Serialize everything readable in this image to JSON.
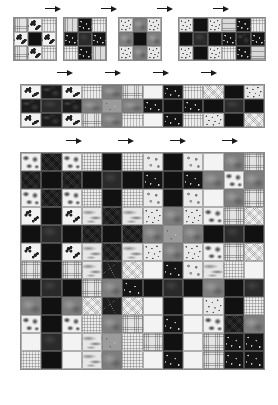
{
  "figure": {
    "background_color": "#ffffff",
    "border_color": "#8a8a8a",
    "arrow_color": "#1a1a1a",
    "arrow_glyph": "right-arrow",
    "levels": [
      {
        "name": "level-1",
        "description": "Four seed panels: 3x3 and 6x3 checkerboards of texture patches",
        "arrow_count": 4
      },
      {
        "name": "level-2",
        "description": "Concatenated strip: 12x3 checkerboard of texture patches",
        "arrow_count": 4
      },
      {
        "name": "level-3",
        "description": "Full expansion: 12x12 checkerboard of texture patches",
        "arrow_count": 4
      }
    ]
  },
  "palette": {
    "dark": "#141414",
    "light": "#ebebeb",
    "mid": "#8c8c8c",
    "grid_line": "#8a8a8a"
  },
  "chart_data": {
    "type": "heatmap",
    "xlabel": "",
    "ylabel": "",
    "grid": true,
    "legend": "none",
    "level1_panels": [
      {
        "id": "panel-1",
        "cols": 3,
        "rows": 3,
        "x": 13,
        "y": 17,
        "w": 44,
        "h": 44,
        "cells": [
          [
            "t-weave-light",
            "t-flower",
            "t-weave-fine"
          ],
          [
            "t-flower",
            "t-plain-dark",
            "t-flower"
          ],
          [
            "t-weave-light",
            "t-flower",
            "t-weave-fine"
          ]
        ]
      },
      {
        "id": "panel-2",
        "cols": 3,
        "rows": 3,
        "x": 63,
        "y": 17,
        "w": 44,
        "h": 44,
        "cells": [
          [
            "t-vstripe",
            "t-dots-dark",
            "t-weave-fine"
          ],
          [
            "t-dots-dark",
            "t-stone-dark",
            "t-dots-dark"
          ],
          [
            "t-weave-fine",
            "t-dots-dark",
            "t-vstripe"
          ]
        ]
      },
      {
        "id": "panel-3",
        "cols": 3,
        "rows": 3,
        "x": 118,
        "y": 17,
        "w": 44,
        "h": 44,
        "cells": [
          [
            "t-speckle-light",
            "t-stone-mid",
            "t-speckle-light"
          ],
          [
            "t-stone-mid",
            "t-plain-dark",
            "t-stone-mid"
          ],
          [
            "t-speckle-light",
            "t-stone-mid",
            "t-speckle-light"
          ]
        ]
      },
      {
        "id": "panel-4",
        "cols": 6,
        "rows": 3,
        "x": 178,
        "y": 17,
        "w": 88,
        "h": 44,
        "cells": [
          [
            "t-speckle-light",
            "t-plain-dark",
            "t-speckle-light",
            "t-hstripe",
            "t-dots-dark",
            "t-weave-fine"
          ],
          [
            "t-plain-dark",
            "t-stone-dark",
            "t-plain-dark",
            "t-dots-dark",
            "t-blob-dark",
            "t-dots-dark"
          ],
          [
            "t-speckle-light",
            "t-plain-dark",
            "t-speckle-light",
            "t-weave-fine",
            "t-dots-dark",
            "t-hstripe"
          ]
        ]
      }
    ],
    "level2_strip": {
      "id": "strip",
      "cols": 12,
      "rows": 3,
      "x": 20,
      "y": 84,
      "w": 245,
      "h": 44,
      "cells": [
        [
          "t-flower",
          "t-blob-dark",
          "t-flower",
          "t-weave-fine",
          "t-stone-mid",
          "t-weave-light",
          "t-plain-light",
          "t-dots-dark",
          "t-weave-fine",
          "t-noise-light",
          "t-plain-dark",
          "t-speckle-light"
        ],
        [
          "t-blob-dark",
          "t-stone-dark",
          "t-blob-dark",
          "t-stone-mid",
          "t-grain-mid",
          "t-stone-mid",
          "t-dots-dark",
          "t-plain-dark",
          "t-dots-dark",
          "t-plain-dark",
          "t-stone-dark",
          "t-plain-dark"
        ],
        [
          "t-flower",
          "t-blob-dark",
          "t-flower",
          "t-weave-light",
          "t-stone-mid",
          "t-weave-fine",
          "t-plain-light",
          "t-dots-dark",
          "t-weave-fine",
          "t-speckle-light",
          "t-plain-dark",
          "t-noise-light"
        ]
      ]
    },
    "level3_grid": {
      "id": "grid",
      "cols": 12,
      "rows": 12,
      "x": 20,
      "y": 152,
      "w": 245,
      "h": 218,
      "cells": [
        [
          "t-blob-light",
          "t-noise-dark",
          "t-blob-light",
          "t-weave-fine",
          "t-plain-dark",
          "t-weave-fine",
          "t-pebble-light",
          "t-plain-dark",
          "t-pebble-light",
          "t-plain-light",
          "t-stone-mid",
          "t-weave-light"
        ],
        [
          "t-noise-dark",
          "t-plain-dark",
          "t-noise-dark",
          "t-plain-dark",
          "t-stone-dark",
          "t-plain-dark",
          "t-dots-dark",
          "t-plain-dark",
          "t-dots-dark",
          "t-stone-mid",
          "t-blob-light",
          "t-stone-mid"
        ],
        [
          "t-blob-light",
          "t-noise-dark",
          "t-blob-light",
          "t-weave-fine",
          "t-plain-dark",
          "t-weave-fine",
          "t-pebble-light",
          "t-plain-dark",
          "t-pebble-light",
          "t-plain-light",
          "t-stone-mid",
          "t-weave-light"
        ],
        [
          "t-flower",
          "t-plain-dark",
          "t-flower",
          "t-marble",
          "t-noise-dark",
          "t-marble",
          "t-speckle-light",
          "t-stone-mid",
          "t-speckle-light",
          "t-blob-light",
          "t-weave-light",
          "t-noise-light"
        ],
        [
          "t-plain-dark",
          "t-stone-dark",
          "t-plain-dark",
          "t-noise-dark",
          "t-plain-dark",
          "t-noise-dark",
          "t-stone-mid",
          "t-grain-mid",
          "t-stone-mid",
          "t-plain-dark",
          "t-stone-dark",
          "t-plain-dark"
        ],
        [
          "t-flower",
          "t-plain-dark",
          "t-flower",
          "t-marble",
          "t-noise-dark",
          "t-marble",
          "t-speckle-light",
          "t-stone-mid",
          "t-speckle-light",
          "t-blob-light",
          "t-weave-light",
          "t-noise-light"
        ],
        [
          "t-weave-light",
          "t-plain-dark",
          "t-weave-light",
          "t-marble",
          "t-crack-dark",
          "t-noise-light",
          "t-plain-light",
          "t-dots-dark",
          "t-pebble-light",
          "t-marble",
          "t-weave-fine",
          "t-plain-light"
        ],
        [
          "t-plain-dark",
          "t-stone-dark",
          "t-plain-dark",
          "t-weave-light",
          "t-stone-mid",
          "t-dots-dark",
          "t-plain-dark",
          "t-stone-dark",
          "t-plain-dark",
          "t-stone-mid",
          "t-plain-dark",
          "t-stone-dark"
        ],
        [
          "t-stone-mid",
          "t-plain-dark",
          "t-stone-mid",
          "t-noise-light",
          "t-crack-dark",
          "t-noise-light",
          "t-plain-light",
          "t-plain-dark",
          "t-plain-light",
          "t-speckle-light",
          "t-plain-dark",
          "t-weave-fine"
        ],
        [
          "t-blob-light",
          "t-plain-dark",
          "t-blob-light",
          "t-weave-fine",
          "t-stone-mid",
          "t-weave-light",
          "t-plain-light",
          "t-dots-dark",
          "t-plain-light",
          "t-blob-light",
          "t-noise-dark",
          "t-stone-mid"
        ],
        [
          "t-plain-light",
          "t-stone-dark",
          "t-plain-light",
          "t-marble",
          "t-grain-mid",
          "t-weave-fine",
          "t-weave-light",
          "t-plain-dark",
          "t-plain-light",
          "t-weave-light",
          "t-dots-dark",
          "t-dots-dark"
        ],
        [
          "t-weave-fine",
          "t-plain-dark",
          "t-plain-light",
          "t-marble",
          "t-stone-mid",
          "t-weave-fine",
          "t-plain-light",
          "t-dots-dark",
          "t-plain-light",
          "t-weave-light",
          "t-dots-dark",
          "t-dots-dark"
        ]
      ]
    },
    "arrows": {
      "level1": [
        {
          "x": 45,
          "y": 6
        },
        {
          "x": 101,
          "y": 6
        },
        {
          "x": 157,
          "y": 6
        },
        {
          "x": 213,
          "y": 6
        }
      ],
      "level1_lower": [
        {
          "x": 57,
          "y": 70
        },
        {
          "x": 105,
          "y": 70
        },
        {
          "x": 153,
          "y": 70
        },
        {
          "x": 201,
          "y": 70
        }
      ],
      "level2": [
        {
          "x": 66,
          "y": 138
        },
        {
          "x": 118,
          "y": 138
        },
        {
          "x": 170,
          "y": 138
        },
        {
          "x": 222,
          "y": 138
        }
      ]
    }
  }
}
